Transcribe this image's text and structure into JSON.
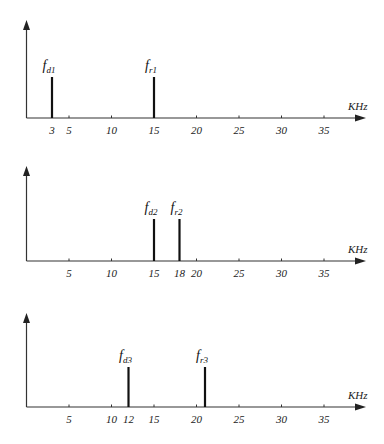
{
  "chart_data": [
    {
      "type": "bar",
      "title": "",
      "xlabel": "KHz",
      "ylabel": "",
      "xlim": [
        0,
        40
      ],
      "grid": false,
      "tick_labels": [
        "3",
        "5",
        "10",
        "15",
        "20",
        "25",
        "30",
        "35"
      ],
      "tick_values": [
        3,
        5,
        10,
        15,
        20,
        25,
        30,
        35
      ],
      "lines": [
        {
          "label_main": "f",
          "label_sub": "d1",
          "x": 3,
          "height": 1
        },
        {
          "label_main": "f",
          "label_sub": "r1",
          "x": 15,
          "height": 1
        }
      ]
    },
    {
      "type": "bar",
      "title": "",
      "xlabel": "KHz",
      "ylabel": "",
      "xlim": [
        0,
        40
      ],
      "grid": false,
      "tick_labels": [
        "5",
        "10",
        "15",
        "18",
        "20",
        "25",
        "30",
        "35"
      ],
      "tick_values": [
        5,
        10,
        15,
        18,
        20,
        25,
        30,
        35
      ],
      "lines": [
        {
          "label_main": "f",
          "label_sub": "d2",
          "x": 15,
          "height": 1
        },
        {
          "label_main": "f",
          "label_sub": "r2",
          "x": 18,
          "height": 1
        }
      ]
    },
    {
      "type": "bar",
      "title": "",
      "xlabel": "KHz",
      "ylabel": "",
      "xlim": [
        0,
        40
      ],
      "grid": false,
      "tick_labels": [
        "5",
        "10",
        "12",
        "15",
        "20",
        "25",
        "30",
        "35"
      ],
      "tick_values": [
        5,
        10,
        12,
        15,
        20,
        25,
        30,
        35
      ],
      "lines": [
        {
          "label_main": "f",
          "label_sub": "d3",
          "x": 12,
          "height": 1
        },
        {
          "label_main": "f",
          "label_sub": "r3",
          "x": 21,
          "height": 1
        }
      ]
    }
  ]
}
